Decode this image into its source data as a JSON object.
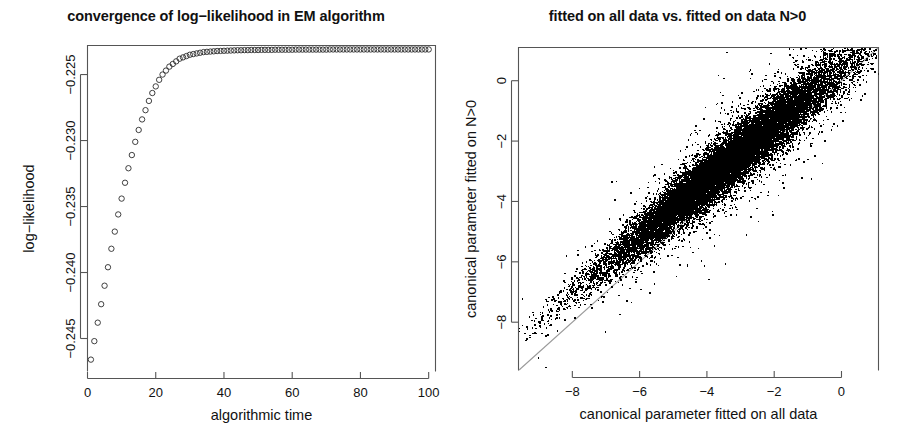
{
  "figure": {
    "width": 903,
    "height": 446,
    "background": "#ffffff",
    "point_color": "#000000",
    "axis_color": "#555555",
    "reference_line_color": "#9a9a9a"
  },
  "panels": {
    "left": {
      "title": "convergence of log−likelihood in EM algorithm",
      "xlabel": "algorithmic time",
      "ylabel": "log−likelihood",
      "xticks": [
        "0",
        "20",
        "40",
        "60",
        "80",
        "100"
      ],
      "yticks": [
        "−0.225",
        "−0.230",
        "−0.235",
        "−0.240",
        "−0.245"
      ]
    },
    "right": {
      "title": "fitted on all data vs. fitted on data N>0",
      "xlabel": "canonical parameter fitted on all data",
      "ylabel": "canonical parameter fitted on N>0",
      "xticks": [
        "−8",
        "−6",
        "−4",
        "−2",
        "0"
      ],
      "yticks": [
        "0",
        "−2",
        "−4",
        "−6",
        "−8"
      ]
    }
  },
  "chart_data": [
    {
      "type": "scatter",
      "id": "em-convergence",
      "title": "convergence of log−likelihood in EM algorithm",
      "xlabel": "algorithmic time",
      "ylabel": "log−likelihood",
      "xlim": [
        0,
        102
      ],
      "ylim": [
        -0.2475,
        -0.2228
      ],
      "xticks": [
        0,
        20,
        40,
        60,
        80,
        100
      ],
      "yticks": [
        -0.225,
        -0.23,
        -0.235,
        -0.24,
        -0.245
      ],
      "grid": false,
      "legend": "none",
      "marker": "open-circle",
      "x": [
        1,
        2,
        3,
        4,
        5,
        6,
        7,
        8,
        9,
        10,
        11,
        12,
        13,
        14,
        15,
        16,
        17,
        18,
        19,
        20,
        21,
        22,
        23,
        24,
        25,
        26,
        27,
        28,
        29,
        30,
        31,
        32,
        33,
        34,
        35,
        36,
        37,
        38,
        39,
        40,
        41,
        42,
        43,
        44,
        45,
        46,
        47,
        48,
        49,
        50,
        51,
        52,
        53,
        54,
        55,
        56,
        57,
        58,
        59,
        60,
        61,
        62,
        63,
        64,
        65,
        66,
        67,
        68,
        69,
        70,
        71,
        72,
        73,
        74,
        75,
        76,
        77,
        78,
        79,
        80,
        81,
        82,
        83,
        84,
        85,
        86,
        87,
        88,
        89,
        90,
        91,
        92,
        93,
        94,
        95,
        96,
        97,
        98,
        99,
        100
      ],
      "y": [
        -0.2466,
        -0.2452,
        -0.2438,
        -0.2424,
        -0.241,
        -0.2396,
        -0.2382,
        -0.2369,
        -0.2356,
        -0.2344,
        -0.2332,
        -0.2321,
        -0.2311,
        -0.2301,
        -0.2292,
        -0.2284,
        -0.2277,
        -0.227,
        -0.2264,
        -0.2259,
        -0.2254,
        -0.225,
        -0.2247,
        -0.2244,
        -0.2242,
        -0.224,
        -0.2238,
        -0.2237,
        -0.2236,
        -0.2235,
        -0.22345,
        -0.2234,
        -0.22335,
        -0.2233,
        -0.22328,
        -0.22326,
        -0.22324,
        -0.22322,
        -0.22321,
        -0.2232,
        -0.22319,
        -0.22318,
        -0.22317,
        -0.22316,
        -0.22316,
        -0.22315,
        -0.22315,
        -0.22314,
        -0.22314,
        -0.22314,
        -0.22313,
        -0.22313,
        -0.22313,
        -0.22313,
        -0.22312,
        -0.22312,
        -0.22312,
        -0.22312,
        -0.22312,
        -0.22312,
        -0.22311,
        -0.22311,
        -0.22311,
        -0.22311,
        -0.22311,
        -0.22311,
        -0.22311,
        -0.22311,
        -0.22311,
        -0.22311,
        -0.2231,
        -0.2231,
        -0.2231,
        -0.2231,
        -0.2231,
        -0.2231,
        -0.2231,
        -0.2231,
        -0.2231,
        -0.2231,
        -0.2231,
        -0.2231,
        -0.2231,
        -0.2231,
        -0.2231,
        -0.2231,
        -0.2231,
        -0.2231,
        -0.2231,
        -0.2231,
        -0.2231,
        -0.2231,
        -0.2231,
        -0.2231,
        -0.2231,
        -0.2231,
        -0.2231,
        -0.2231,
        -0.2231,
        -0.2231
      ]
    },
    {
      "type": "scatter",
      "id": "fitted-comparison",
      "title": "fitted on all data vs. fitted on data N>0",
      "xlabel": "canonical parameter fitted on all data",
      "ylabel": "canonical parameter fitted on N>0",
      "xlim": [
        -9.6,
        1.1
      ],
      "ylim": [
        -9.6,
        1.1
      ],
      "xticks": [
        -8,
        -6,
        -4,
        -2,
        0
      ],
      "yticks": [
        0,
        -2,
        -4,
        -6,
        -8
      ],
      "grid": false,
      "legend": "none",
      "marker": "filled-dot",
      "annotation": "gray identity reference line y = x drawn corner to corner",
      "reference_line": {
        "slope": 1,
        "intercept": 0
      },
      "n_points": 20000,
      "cloud": {
        "x_center": -3.4,
        "y_center": -3.05,
        "x_spread": 1.75,
        "correlation": 0.93,
        "residual_spread": 0.55,
        "offset_above_identity": 0.35
      }
    }
  ]
}
